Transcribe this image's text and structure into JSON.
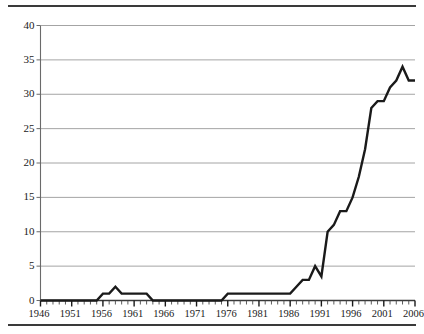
{
  "chart_data": {
    "type": "line",
    "title": "",
    "subtitle": "",
    "xlabel": "",
    "ylabel": "",
    "xlim": [
      1946,
      2006
    ],
    "ylim": [
      0,
      40
    ],
    "grid": "horizontal",
    "legend": "none",
    "y_ticks": [
      0,
      5,
      10,
      15,
      20,
      25,
      30,
      35,
      40
    ],
    "y_tick_labels": [
      "0",
      "5",
      "10",
      "15",
      "20",
      "25",
      "30",
      "35",
      "40"
    ],
    "x_ticks": [
      1946,
      1951,
      1956,
      1961,
      1966,
      1971,
      1976,
      1981,
      1986,
      1991,
      1996,
      2001,
      2006
    ],
    "x_tick_labels": [
      "1946",
      "1951",
      "1956",
      "1961",
      "1966",
      "1971",
      "1976",
      "1981",
      "1986",
      "1991",
      "1996",
      "2001",
      "2006"
    ],
    "x_minor_tick_step": 1,
    "series": [
      {
        "name": "value",
        "color": "#1a1a1a",
        "x": [
          1946,
          1947,
          1948,
          1949,
          1950,
          1951,
          1952,
          1953,
          1954,
          1955,
          1956,
          1957,
          1958,
          1959,
          1960,
          1961,
          1962,
          1963,
          1964,
          1965,
          1966,
          1967,
          1968,
          1969,
          1970,
          1971,
          1972,
          1973,
          1974,
          1975,
          1976,
          1977,
          1978,
          1979,
          1980,
          1981,
          1982,
          1983,
          1984,
          1985,
          1986,
          1987,
          1988,
          1989,
          1990,
          1991,
          1992,
          1993,
          1994,
          1995,
          1996,
          1997,
          1998,
          1999,
          2000,
          2001,
          2002,
          2003,
          2004,
          2005,
          2006
        ],
        "values": [
          0,
          0,
          0,
          0,
          0,
          0,
          0,
          0,
          0,
          0,
          1,
          1,
          2,
          1,
          1,
          1,
          1,
          1,
          0,
          0,
          0,
          0,
          0,
          0,
          0,
          0,
          0,
          0,
          0,
          0,
          1,
          1,
          1,
          1,
          1,
          1,
          1,
          1,
          1,
          1,
          1,
          2,
          3,
          3,
          5,
          3.5,
          10,
          11,
          13,
          13,
          15,
          18,
          22,
          28,
          29,
          29,
          31,
          32,
          34,
          32,
          32
        ]
      }
    ]
  }
}
